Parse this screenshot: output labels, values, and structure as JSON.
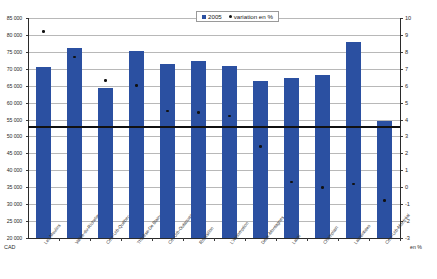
{
  "chart_data": {
    "type": "bar",
    "title": "",
    "subtitle": "",
    "xlabel": "",
    "ylabel": "CAD",
    "ylabel_right": "en %",
    "ylim": [
      20000,
      85000
    ],
    "ylim_right": [
      -3,
      10
    ],
    "grid": true,
    "legend_position": "top-right",
    "categories": [
      "Les Moulins",
      "Vallée-du-Richelieu",
      "Cmn-Urb-Québec",
      "Thérèse-De Blainville",
      "Cm-Urb-Outaouais",
      "Roussillon",
      "L'Assomption",
      "Deux-Montagnes",
      "Laval",
      "Champlain",
      "Laurentides",
      "Cmn-Urb-Montréal"
    ],
    "series": [
      {
        "name": "2005",
        "axis": "left",
        "type": "bar",
        "unit": "CAD",
        "color": "#2b50a1",
        "values": [
          70500,
          76000,
          64200,
          75200,
          71500,
          72400,
          70700,
          66500,
          67200,
          68200,
          78000,
          54500
        ]
      },
      {
        "name": "variation en %",
        "axis": "right",
        "type": "scatter",
        "unit": "%",
        "color": "#111111",
        "values": [
          9.2,
          7.7,
          6.3,
          6.0,
          4.5,
          4.4,
          4.2,
          2.4,
          0.3,
          0.0,
          0.2,
          -0.8
        ]
      }
    ],
    "reference_line": {
      "label": "",
      "value_left": 53000,
      "value_right": 3.6,
      "color": "#111111"
    },
    "yticks": [
      "85 000",
      "80 000",
      "75 000",
      "70 000",
      "65 000",
      "60 000",
      "55 000",
      "50 000",
      "45 000",
      "40 000",
      "35 000",
      "30 000",
      "25 000",
      "20 000"
    ],
    "yticks_right": [
      "10",
      "9",
      "8",
      "7",
      "6",
      "5",
      "4",
      "3",
      "2",
      "1",
      "0",
      "-1",
      "-2",
      "-3"
    ]
  },
  "legend": {
    "items": [
      {
        "label": "2005",
        "marker": "square-marker"
      },
      {
        "label": "variation en %",
        "marker": "dot-marker"
      }
    ]
  },
  "axis_corner": {
    "left_label": "CAD",
    "right_label": "en %"
  }
}
